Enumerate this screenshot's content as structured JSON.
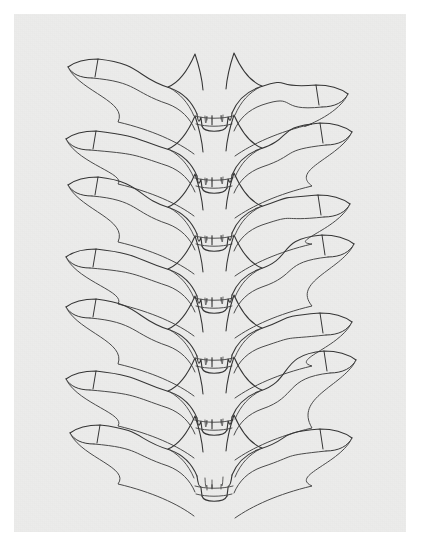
{
  "image": {
    "kind": "scanned-line-drawing",
    "subject": "vertebral-column-anterior-view",
    "title": "Stacked vertebrae line drawing",
    "width_px": 423,
    "height_px": 559,
    "background_color": "#ffffff",
    "paper_color": "#ececeb",
    "ink_color": "#4a4a4a",
    "ink_color_dark": "#353535",
    "stroke_width": 1.0
  },
  "paper": {
    "left": 14,
    "top": 14,
    "width": 392,
    "height": 518
  },
  "drawing": {
    "element_count": 7,
    "element_name": "vertebra",
    "parts": [
      "left-transverse-process",
      "right-transverse-process",
      "spinous-process",
      "vertebral-body",
      "superior-articular-facet-left",
      "superior-articular-facet-right"
    ],
    "center_x": 214,
    "vertebrae": [
      {
        "index": 1,
        "label": "vertebra-1",
        "center_y": 96,
        "left_tip_x": 68,
        "left_tip_y": 62,
        "right_tip_x": 348,
        "right_tip_y": 90,
        "wing_thickness": 17,
        "spine_bottom_y": 128,
        "scale": 1.0
      },
      {
        "index": 2,
        "label": "vertebra-2",
        "center_y": 158,
        "left_tip_x": 66,
        "left_tip_y": 134,
        "right_tip_x": 352,
        "right_tip_y": 128,
        "wing_thickness": 17,
        "spine_bottom_y": 190,
        "scale": 1.0
      },
      {
        "index": 3,
        "label": "vertebra-3",
        "center_y": 216,
        "left_tip_x": 68,
        "left_tip_y": 180,
        "right_tip_x": 350,
        "right_tip_y": 200,
        "wing_thickness": 17,
        "spine_bottom_y": 248,
        "scale": 1.0
      },
      {
        "index": 4,
        "label": "vertebra-4",
        "center_y": 278,
        "left_tip_x": 66,
        "left_tip_y": 252,
        "right_tip_x": 354,
        "right_tip_y": 240,
        "wing_thickness": 17,
        "spine_bottom_y": 310,
        "scale": 1.0
      },
      {
        "index": 5,
        "label": "vertebra-5",
        "center_y": 338,
        "left_tip_x": 66,
        "left_tip_y": 302,
        "right_tip_x": 352,
        "right_tip_y": 318,
        "wing_thickness": 17,
        "spine_bottom_y": 370,
        "scale": 1.0
      },
      {
        "index": 6,
        "label": "vertebra-6",
        "center_y": 400,
        "left_tip_x": 66,
        "left_tip_y": 374,
        "right_tip_x": 356,
        "right_tip_y": 356,
        "wing_thickness": 17,
        "spine_bottom_y": 432,
        "scale": 1.0
      },
      {
        "index": 7,
        "label": "vertebra-7",
        "center_y": 458,
        "left_tip_x": 70,
        "left_tip_y": 428,
        "right_tip_x": 352,
        "right_tip_y": 434,
        "wing_thickness": 18,
        "spine_bottom_y": 498,
        "scale": 1.02
      }
    ]
  }
}
